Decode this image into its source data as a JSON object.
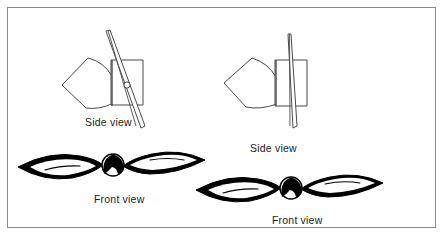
{
  "figure": {
    "background_color": "#ffffff",
    "border_color": "#8a8a8a",
    "ink_color": "#1b1b1b",
    "fill_color": "#000000",
    "width": 446,
    "height": 245
  },
  "assemblies": [
    {
      "id": "coarse-pitch",
      "name": "Coarse pitch propeller",
      "position": "left",
      "side_label": "Side view",
      "front_label": "Front view",
      "blade_angle_description": "steeply angled blade, high pitch",
      "has_hub_bolt": true
    },
    {
      "id": "fine-pitch",
      "name": "Fine pitch propeller",
      "position": "right",
      "side_label": "Side view",
      "front_label": "Front view",
      "blade_angle_description": "nearly vertical blade, low pitch",
      "has_hub_bolt": false
    }
  ],
  "labels": {
    "side_view_left": "Side view",
    "front_view_left": "Front view",
    "side_view_right": "Side view",
    "front_view_right": "Front view"
  },
  "icons": {
    "spinner": "spinner-cone-icon",
    "hub": "hub-rectangle-icon",
    "blade": "propeller-blade-icon",
    "bolt": "hub-bolt-icon",
    "disc": "propeller-disc-icon"
  }
}
